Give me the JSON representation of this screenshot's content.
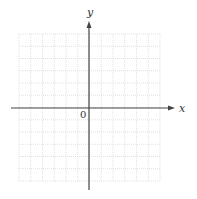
{
  "figure": {
    "type": "coordinate-plane",
    "x_axis_label": "x",
    "y_axis_label": "y",
    "origin_label": "0",
    "grid": {
      "columns": 12,
      "rows": 12,
      "left": 19,
      "top": 34,
      "right": 160,
      "bottom": 181,
      "line_color": "#d9d9d9",
      "style": "dotted"
    },
    "axes": {
      "origin_x": 89,
      "origin_y": 108,
      "x_start": 11,
      "x_end": 175,
      "y_start": 21,
      "y_end": 190,
      "color": "#444444"
    }
  }
}
